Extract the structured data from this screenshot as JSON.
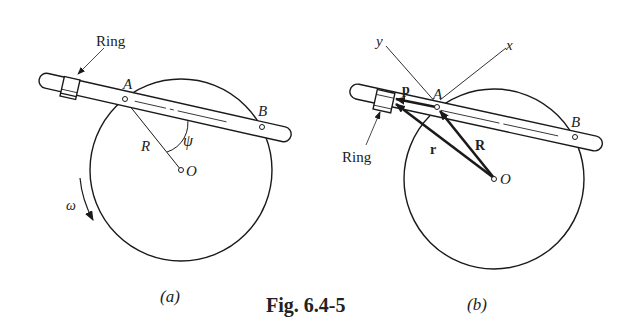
{
  "figure": {
    "caption": "Fig. 6.4-5",
    "panels": [
      {
        "id": "a",
        "label": "(a)",
        "ring_label": "Ring",
        "point_A": "A",
        "point_B": "B",
        "point_O": "O",
        "radius_label": "R",
        "angle_label": "ψ",
        "angular_velocity_label": "ω"
      },
      {
        "id": "b",
        "label": "(b)",
        "ring_label": "Ring",
        "point_A": "A",
        "point_B": "B",
        "point_O": "O",
        "axis_x": "x",
        "axis_y": "y",
        "vector_p": "p",
        "vector_r": "r",
        "vector_R": "R"
      }
    ]
  },
  "colors": {
    "ink": "#1a1a1a",
    "background": "#ffffff"
  }
}
